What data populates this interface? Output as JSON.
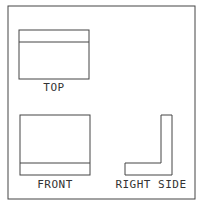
{
  "views": {
    "top": {
      "label": "TOP"
    },
    "front": {
      "label": "FRONT"
    },
    "right_side": {
      "label": "RIGHT SIDE"
    }
  },
  "colors": {
    "stroke": "#444444",
    "background": "#ffffff"
  }
}
